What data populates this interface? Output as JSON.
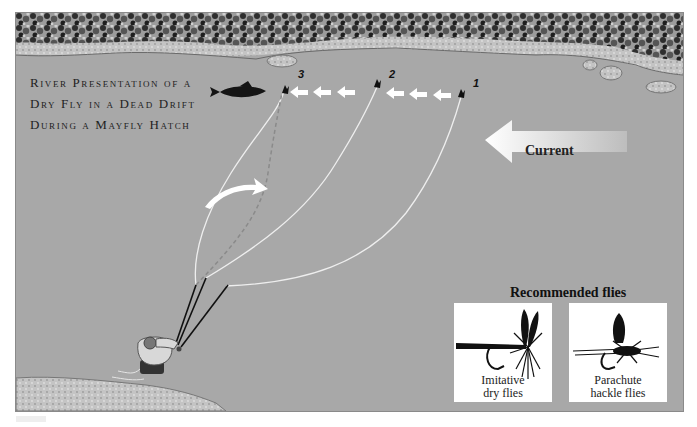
{
  "diagram": {
    "title_lines": [
      "River Presentation of a",
      "Dry Fly in a Dead Drift",
      "During a Mayfly Hatch"
    ],
    "fly_positions": [
      {
        "label": "1",
        "x": 461,
        "y": 93
      },
      {
        "label": "2",
        "x": 378,
        "y": 83
      },
      {
        "label": "3",
        "x": 285,
        "y": 86
      }
    ],
    "current_arrow": {
      "label": "Current",
      "direction": "left"
    },
    "recommended": {
      "title": "Recommended flies",
      "items": [
        {
          "line1": "Imitative",
          "line2": "dry flies",
          "icon": "mayfly-dry-fly-icon"
        },
        {
          "line1": "Parachute",
          "line2": "hackle flies",
          "icon": "parachute-fly-icon"
        }
      ]
    },
    "colors": {
      "water": "#a8a8a8",
      "bank": "#c9c9c9",
      "foliage": "#3a3a3a",
      "line": "#f2f2f2",
      "arrow": "#ffffff",
      "card": "#ffffff"
    }
  }
}
